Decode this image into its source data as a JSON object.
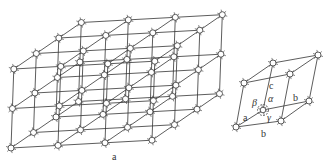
{
  "figure": {
    "panels": [
      {
        "id": "lattice",
        "caption": "a",
        "description": "3D crystal lattice, 3x3x2 unit cells",
        "cells_x": 3,
        "cells_y": 3,
        "cells_z": 2
      },
      {
        "id": "unit-cell",
        "caption": "",
        "description": "Single unit cell with lattice parameters",
        "edge_labels": {
          "a": "a",
          "b_top": "b",
          "b_bottom": "b",
          "c": "c"
        },
        "angle_labels": {
          "alpha": "α",
          "beta": "β",
          "gamma": "γ"
        }
      }
    ],
    "colors": {
      "line": "#333333",
      "node_fill": "#ffffff",
      "background": "#ffffff"
    }
  }
}
